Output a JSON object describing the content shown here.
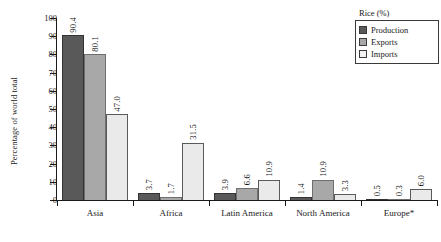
{
  "chart_data": {
    "type": "bar",
    "title": "",
    "xlabel": "",
    "ylabel": "Percentage of world total",
    "ylim": [
      0,
      100
    ],
    "yticks": [
      0,
      10,
      20,
      30,
      40,
      50,
      60,
      70,
      80,
      90,
      100
    ],
    "grid": false,
    "legend_position": "top-right",
    "legend_title": "Rice (%)",
    "categories": [
      "Asia",
      "Africa",
      "Latin America",
      "North America",
      "Europe*"
    ],
    "series": [
      {
        "name": "Production",
        "color": "#595959",
        "values": [
          90.4,
          3.7,
          3.9,
          1.4,
          0.5
        ]
      },
      {
        "name": "Exports",
        "color": "#a8a8a8",
        "values": [
          80.1,
          1.7,
          6.6,
          10.9,
          0.3
        ]
      },
      {
        "name": "Imports",
        "color": "#eaeaea",
        "values": [
          47.0,
          31.5,
          10.9,
          3.3,
          6.0
        ]
      }
    ],
    "data_labels": {
      "Asia": [
        "90.4",
        "80.1",
        "47.0"
      ],
      "Africa": [
        "3.7",
        "1.7",
        "31.5"
      ],
      "Latin America": [
        "3.9",
        "6.6",
        "10.9"
      ],
      "North America": [
        "1.4",
        "10.9",
        "3.3"
      ],
      "Europe*": [
        "0.5",
        "0.3",
        "6.0"
      ]
    }
  },
  "axis": {
    "y_title": "Percentage of world total",
    "y_tick_labels": [
      "100",
      "90",
      "80",
      "70",
      "60",
      "50",
      "40",
      "30",
      "20",
      "10",
      "0"
    ]
  },
  "legend": {
    "title": "Rice (%)",
    "items": [
      {
        "label": "Production"
      },
      {
        "label": "Exports"
      },
      {
        "label": "Imports"
      }
    ]
  }
}
